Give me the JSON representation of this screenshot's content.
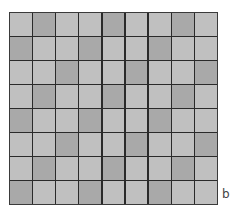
{
  "figure": {
    "label": "b",
    "rows": 8,
    "columns": 9,
    "colors": {
      "light": "#c0c0c0",
      "dark": "#a9a9a9",
      "line": "#2a2a2a"
    },
    "pattern": [
      [
        0,
        1,
        0,
        0,
        1,
        0,
        0,
        1,
        0
      ],
      [
        1,
        0,
        0,
        1,
        0,
        0,
        1,
        0,
        0
      ],
      [
        0,
        0,
        1,
        0,
        0,
        1,
        0,
        0,
        1
      ],
      [
        0,
        1,
        0,
        0,
        1,
        0,
        0,
        1,
        0
      ],
      [
        1,
        0,
        0,
        1,
        0,
        0,
        1,
        0,
        0
      ],
      [
        0,
        0,
        1,
        0,
        0,
        1,
        0,
        0,
        1
      ],
      [
        0,
        1,
        0,
        0,
        1,
        0,
        0,
        1,
        0
      ],
      [
        1,
        0,
        0,
        1,
        0,
        0,
        1,
        0,
        0
      ]
    ]
  }
}
